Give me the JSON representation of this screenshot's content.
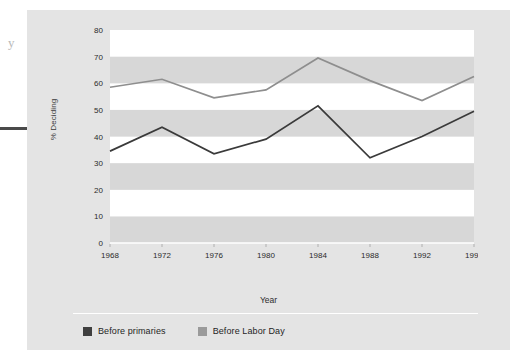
{
  "figure": {
    "background_color": "#e4e4e4",
    "band_color": "#d7d7d7",
    "plot_white": "#ffffff"
  },
  "scan_artifacts": {
    "marginal_glyph": "y"
  },
  "legend": {
    "position": "bottom-left",
    "entries": [
      {
        "label": "Before primaries",
        "color": "#3f3f3f"
      },
      {
        "label": "Before Labor Day",
        "color": "#9a9a9a"
      }
    ]
  },
  "chart_data": {
    "type": "line",
    "title": "",
    "subtitle": "",
    "xlabel": "Year",
    "ylabel": "% Deciding",
    "categories": [
      "1968",
      "1972",
      "1976",
      "1980",
      "1984",
      "1988",
      "1992",
      "1996"
    ],
    "x": [
      1968,
      1972,
      1976,
      1980,
      1984,
      1988,
      1992,
      1996
    ],
    "xlim": [
      1968,
      1996
    ],
    "ylim": [
      0,
      80
    ],
    "yticks": [
      0,
      10,
      20,
      30,
      40,
      50,
      60,
      70,
      80
    ],
    "ytick_labels": [
      "0",
      "10",
      "20",
      "30",
      "40",
      "50",
      "60",
      "70",
      "80"
    ],
    "grid": false,
    "banded_background": true,
    "legend_position": "bottom-left",
    "series": [
      {
        "name": "Before Labor Day",
        "color": "#8e8e8e",
        "values": [
          58.5,
          61.5,
          54.5,
          57.5,
          69.5,
          61,
          53.5,
          62.5
        ]
      },
      {
        "name": "Before primaries",
        "color": "#3a3a3a",
        "values": [
          34.5,
          43.5,
          33.5,
          39,
          51.5,
          32,
          40,
          49.5
        ]
      }
    ]
  }
}
